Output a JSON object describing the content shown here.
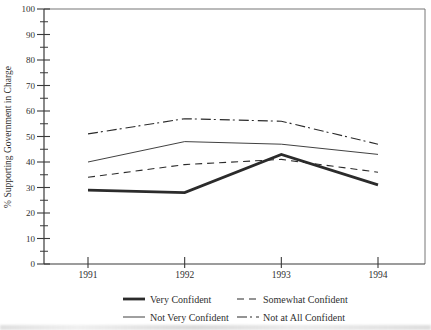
{
  "figure": {
    "background": "#ffffff",
    "ink_color": "#2b2b2b",
    "frame_color": "#777777",
    "axis_color": "#3a3a3a",
    "text_color": "#2f2f2f"
  },
  "chart_data": {
    "type": "line",
    "title": "",
    "xlabel": "",
    "ylabel": "% Supporting Government in Charge",
    "categories": [
      "1991",
      "1992",
      "1993",
      "1994"
    ],
    "series": [
      {
        "name": "Very Confident",
        "style": "solid-thick",
        "values": [
          29,
          28,
          43,
          31
        ]
      },
      {
        "name": "Somewhat Confident",
        "style": "dashed",
        "values": [
          34,
          39,
          41,
          36
        ]
      },
      {
        "name": "Not Very Confident",
        "style": "solid-thin",
        "values": [
          40,
          48,
          47,
          43
        ]
      },
      {
        "name": "Not at All Confident",
        "style": "dash-dot",
        "values": [
          51,
          57,
          56,
          47
        ]
      }
    ],
    "ylim": [
      0,
      100
    ],
    "y_major_ticks": [
      0,
      10,
      20,
      30,
      40,
      50,
      60,
      70,
      80,
      90,
      100
    ],
    "y_minor_step": 5,
    "grid": false,
    "legend_position": "bottom",
    "legend": [
      {
        "label": "Very Confident",
        "style": "solid-thick"
      },
      {
        "label": "Somewhat Confident",
        "style": "dashed"
      },
      {
        "label": "Not Very Confident",
        "style": "solid-thin"
      },
      {
        "label": "Not at All Confident",
        "style": "dash-dot"
      }
    ]
  }
}
